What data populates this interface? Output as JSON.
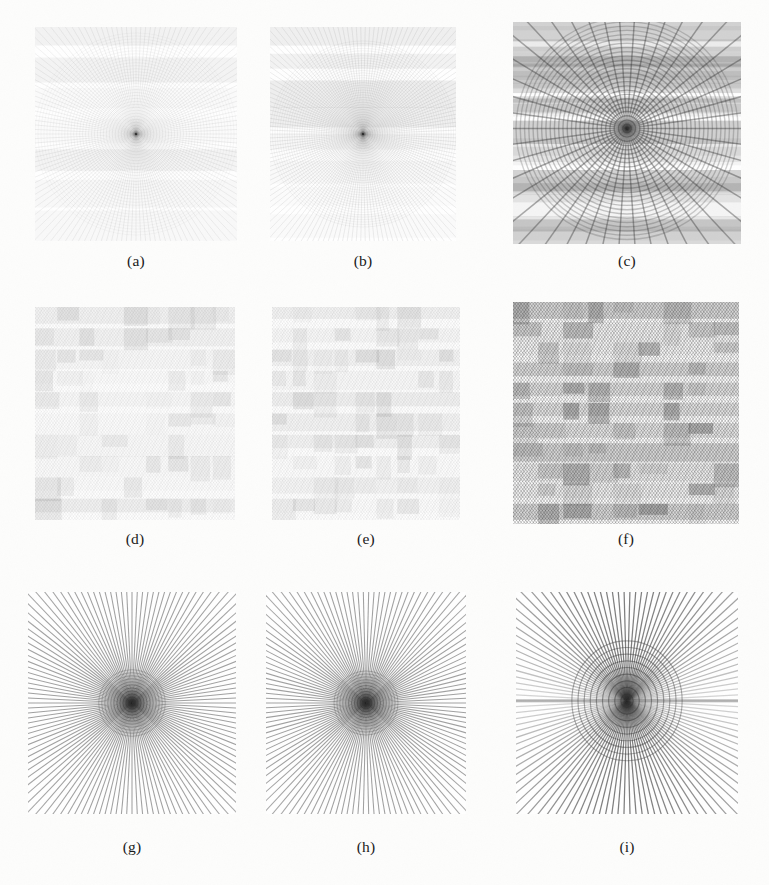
{
  "figure": {
    "type": "image-grid",
    "rows": 3,
    "columns": 3,
    "background_color": "#fdfdfc",
    "ink_color": "#303030",
    "caption_color": "#181818",
    "panels": [
      {
        "id": "a",
        "caption": "(a)",
        "pattern": "radial-moire",
        "description": "very faint concentric/radial interference moire, light tone",
        "x": 35,
        "y": 27,
        "width": 202,
        "height": 214,
        "caption_x": 35,
        "caption_y": 252,
        "caption_width": 202,
        "spokes": 140,
        "rings": 34,
        "ring_scale": 1.0,
        "center_x": 0.5,
        "center_y": 0.5,
        "line_width": 0.42,
        "opacity": 0.16,
        "tilt": 0,
        "banding": 7,
        "band_opacity": 0.05,
        "vertical_squeeze": 1.0
      },
      {
        "id": "b",
        "caption": "(b)",
        "pattern": "radial-moire",
        "description": "very faint concentric/radial interference moire, slightly denser than (a)",
        "x": 270,
        "y": 27,
        "width": 186,
        "height": 214,
        "caption_x": 270,
        "caption_y": 252,
        "caption_width": 186,
        "spokes": 150,
        "rings": 38,
        "ring_scale": 1.0,
        "center_x": 0.5,
        "center_y": 0.5,
        "line_width": 0.45,
        "opacity": 0.19,
        "tilt": 0,
        "banding": 8,
        "band_opacity": 0.06,
        "vertical_squeeze": 1.0
      },
      {
        "id": "c",
        "caption": "(c)",
        "pattern": "radial-fan-moire",
        "description": "strong fan of radial spokes from centre with horizontal banding, mid grey",
        "x": 513,
        "y": 22,
        "width": 228,
        "height": 222,
        "caption_x": 513,
        "caption_y": 252,
        "caption_width": 228,
        "spokes": 46,
        "rings": 26,
        "ring_scale": 1.0,
        "center_x": 0.5,
        "center_y": 0.48,
        "line_width": 1.5,
        "opacity": 0.4,
        "tilt": 0,
        "banding": 9,
        "band_opacity": 0.18,
        "vertical_squeeze": 1.0
      },
      {
        "id": "d",
        "caption": "(d)",
        "pattern": "crosshatch-moire",
        "description": "faint dense diagonal crosshatch texture with soft horizontal bands",
        "x": 35,
        "y": 307,
        "width": 200,
        "height": 213,
        "caption_x": 35,
        "caption_y": 530,
        "caption_width": 200,
        "hatch_angle": 38,
        "hatch_spacing": 2.3,
        "line_width": 0.5,
        "opacity": 0.17,
        "banding": 10,
        "band_opacity": 0.05
      },
      {
        "id": "e",
        "caption": "(e)",
        "pattern": "crosshatch-moire",
        "description": "faint dense diagonal crosshatch texture, near identical to (d)",
        "x": 272,
        "y": 307,
        "width": 188,
        "height": 213,
        "caption_x": 272,
        "caption_y": 530,
        "caption_width": 188,
        "hatch_angle": 38,
        "hatch_spacing": 2.25,
        "line_width": 0.5,
        "opacity": 0.18,
        "banding": 10,
        "band_opacity": 0.05
      },
      {
        "id": "f",
        "caption": "(f)",
        "pattern": "crosshatch-moire",
        "description": "strong dense diagonal crosshatch moire, mid-grey with blocky horizontal bands",
        "x": 513,
        "y": 302,
        "width": 226,
        "height": 222,
        "caption_x": 513,
        "caption_y": 530,
        "caption_width": 226,
        "hatch_angle": 38,
        "hatch_spacing": 2.4,
        "line_width": 1.05,
        "opacity": 0.4,
        "banding": 11,
        "band_opacity": 0.16
      },
      {
        "id": "g",
        "caption": "(g)",
        "pattern": "starburst-zoneplate",
        "description": "strong starburst of radial spokes with concentric rings in the centre",
        "x": 28,
        "y": 592,
        "width": 208,
        "height": 222,
        "caption_x": 28,
        "caption_y": 838,
        "caption_width": 208,
        "spokes": 132,
        "rings": 11,
        "ring_scale": 0.32,
        "center_x": 0.5,
        "center_y": 0.5,
        "line_width": 1.05,
        "opacity": 0.46,
        "tilt": 0,
        "dipole": 0,
        "vertical_squeeze": 1.0
      },
      {
        "id": "h",
        "caption": "(h)",
        "pattern": "starburst-zoneplate",
        "description": "strong starburst of radial spokes with concentric rings in the centre, as (g)",
        "x": 266,
        "y": 592,
        "width": 200,
        "height": 222,
        "caption_x": 266,
        "caption_y": 838,
        "caption_width": 200,
        "spokes": 130,
        "rings": 11,
        "ring_scale": 0.32,
        "center_x": 0.5,
        "center_y": 0.5,
        "line_width": 1.05,
        "opacity": 0.46,
        "tilt": 0,
        "dipole": 0,
        "vertical_squeeze": 1.0
      },
      {
        "id": "i",
        "caption": "(i)",
        "pattern": "starburst-dipole",
        "description": "starburst of radial spokes with a two-lobed butterfly / dipole structure about the centre and a dark horizontal seam",
        "x": 516,
        "y": 592,
        "width": 222,
        "height": 222,
        "caption_x": 516,
        "caption_y": 838,
        "caption_width": 222,
        "spokes": 118,
        "rings": 9,
        "ring_scale": 0.4,
        "center_x": 0.5,
        "center_y": 0.49,
        "line_width": 1.25,
        "opacity": 0.52,
        "tilt": 0,
        "dipole": 1,
        "vertical_squeeze": 1.0
      }
    ]
  }
}
